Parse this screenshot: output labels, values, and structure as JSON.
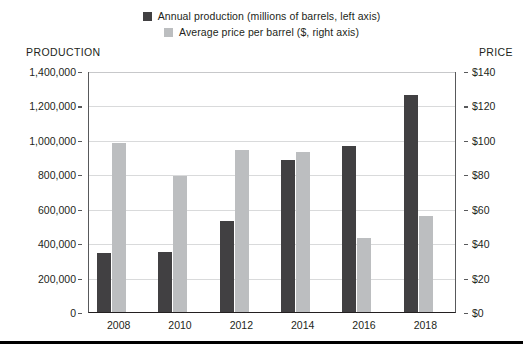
{
  "legend": {
    "items": [
      {
        "label": "Annual production (millions of barrels, left axis)",
        "color": "#414042",
        "key": "production"
      },
      {
        "label": "Average price per barrel ($, right axis)",
        "color": "#bcbec0",
        "key": "price"
      }
    ]
  },
  "axes": {
    "left_title": "PRODUCTION",
    "right_title": "PRICE",
    "left_ticks": [
      "1,400,000",
      "1,200,000",
      "1,000,000",
      "800,000",
      "600,000",
      "400,000",
      "200,000",
      "0"
    ],
    "right_ticks": [
      "$140",
      "$120",
      "$100",
      "$80",
      "$60",
      "$40",
      "$20",
      "$0"
    ]
  },
  "chart_data": {
    "type": "bar",
    "title": "",
    "xlabel": "",
    "ylabel": "PRODUCTION",
    "y2label": "PRICE",
    "categories": [
      "2008",
      "2010",
      "2012",
      "2014",
      "2016",
      "2018"
    ],
    "series": [
      {
        "name": "Annual production (millions of barrels, left axis)",
        "axis": "left",
        "color": "#414042",
        "values": [
          340000,
          350000,
          530000,
          885000,
          965000,
          1260000
        ]
      },
      {
        "name": "Average price per barrel ($, right axis)",
        "axis": "right",
        "color": "#bcbec0",
        "values": [
          98,
          79,
          94,
          93,
          43,
          56
        ]
      }
    ],
    "ylim": [
      0,
      1400000
    ],
    "y2lim": [
      0,
      140
    ],
    "ytick_step": 200000,
    "y2tick_step": 20,
    "grid": true,
    "legend_position": "top-center"
  }
}
